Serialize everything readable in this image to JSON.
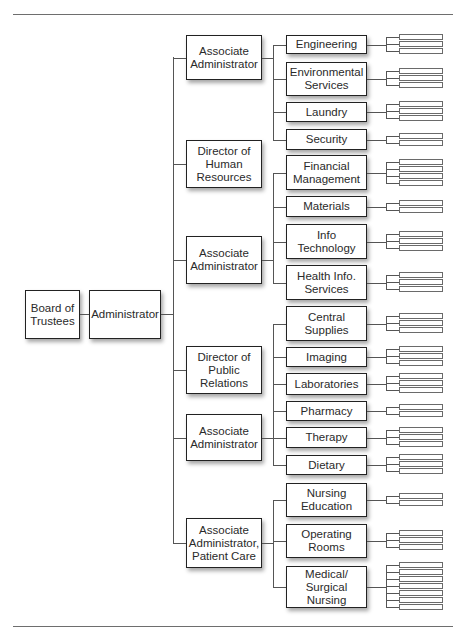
{
  "chart": {
    "root": {
      "label": "Board of\nTrustees"
    },
    "administrator": {
      "label": "Administrator"
    },
    "divisions": [
      {
        "label": "Associate\nAdministrator",
        "departments": [
          {
            "label": "Engineering",
            "sub_units": 3
          },
          {
            "label": "Environmental\nServices",
            "sub_units": 3
          },
          {
            "label": "Laundry",
            "sub_units": 3
          },
          {
            "label": "Security",
            "sub_units": 2
          }
        ]
      },
      {
        "label": "Director of\nHuman\nResources",
        "departments": []
      },
      {
        "label": "Associate\nAdministrator",
        "departments": [
          {
            "label": "Financial\nManagement",
            "sub_units": 4
          },
          {
            "label": "Materials",
            "sub_units": 2
          },
          {
            "label": "Info\nTechnology",
            "sub_units": 3
          },
          {
            "label": "Health Info.\nServices",
            "sub_units": 3
          }
        ]
      },
      {
        "label": "Director of\nPublic\nRelations",
        "departments": []
      },
      {
        "label": "Associate\nAdministrator",
        "departments": [
          {
            "label": "Central\nSupplies",
            "sub_units": 3
          },
          {
            "label": "Imaging",
            "sub_units": 3
          },
          {
            "label": "Laboratories",
            "sub_units": 3
          },
          {
            "label": "Pharmacy",
            "sub_units": 2
          },
          {
            "label": "Therapy",
            "sub_units": 3
          },
          {
            "label": "Dietary",
            "sub_units": 3
          }
        ]
      },
      {
        "label": "Associate\nAdministrator,\nPatient Care",
        "departments": [
          {
            "label": "Nursing\nEducation",
            "sub_units": 2
          },
          {
            "label": "Operating\nRooms",
            "sub_units": 3
          },
          {
            "label": "Medical/\nSurgical\nNursing",
            "sub_units": 7
          }
        ]
      }
    ]
  },
  "colors": {
    "line": "#555555",
    "box_border": "#222222",
    "rule": "#6e6e6e"
  }
}
